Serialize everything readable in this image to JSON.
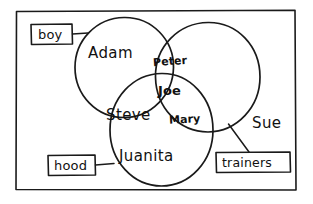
{
  "diagram": {
    "kind": "venn-diagram",
    "frame": {
      "name": "outer-border"
    },
    "sets": [
      {
        "id": "adam-circle",
        "label": "Adam",
        "position": "top-left"
      },
      {
        "id": "sue-circle",
        "label": "Sue",
        "position": "top-right"
      },
      {
        "id": "juanita-circle",
        "label": "Juanita",
        "position": "bottom-center"
      }
    ],
    "members": [
      {
        "name": "Adam",
        "region": "adam-only"
      },
      {
        "name": "Peter",
        "region": "adam-and-sue"
      },
      {
        "name": "Joe",
        "region": "all-three"
      },
      {
        "name": "Steve",
        "region": "adam-and-juanita"
      },
      {
        "name": "Mary",
        "region": "sue-and-juanita"
      },
      {
        "name": "Juanita",
        "region": "juanita-only"
      },
      {
        "name": "Sue",
        "region": "sue-only"
      }
    ],
    "annotations": [
      {
        "id": "boy-tag",
        "label": "boy",
        "attached_to": "adam-circle"
      },
      {
        "id": "hood-tag",
        "label": "hood",
        "attached_to": "juanita-circle"
      },
      {
        "id": "trainers-tag",
        "label": "trainers",
        "attached_to": "sue-circle"
      }
    ],
    "colors": {
      "ink": "#1a1a1a",
      "text": "#111111",
      "background": "#ffffff"
    }
  }
}
